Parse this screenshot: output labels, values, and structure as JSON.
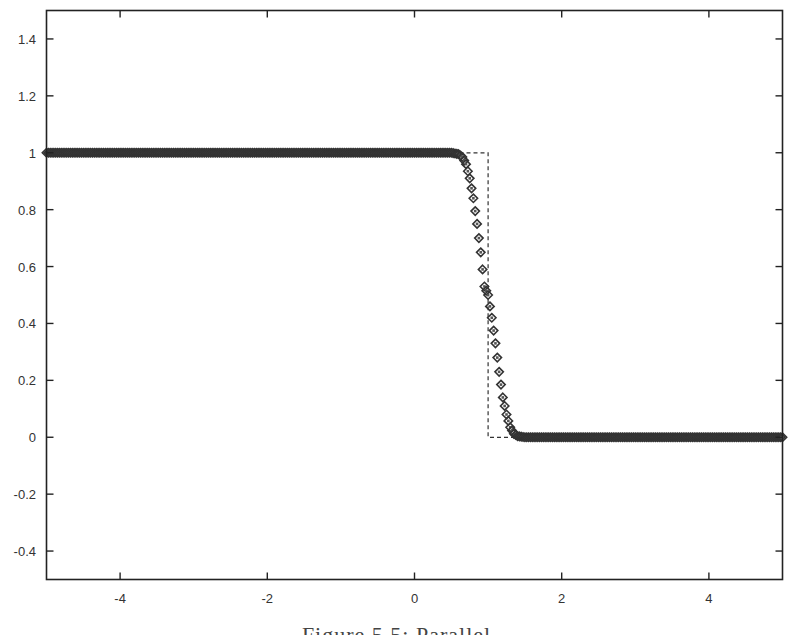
{
  "chart_data": {
    "type": "scatter",
    "title": "",
    "xlabel": "",
    "ylabel": "",
    "xlim": [
      -5,
      5
    ],
    "ylim": [
      -0.5,
      1.5
    ],
    "grid": false,
    "legend": null,
    "x_ticks": [
      -4,
      -2,
      0,
      2,
      4
    ],
    "x_tick_labels": [
      "-4",
      "-2",
      "0",
      "2",
      "4"
    ],
    "y_ticks": [
      -0.4,
      -0.2,
      0,
      0.2,
      0.4,
      0.6,
      0.8,
      1,
      1.2,
      1.4
    ],
    "y_tick_labels": [
      "-0.4",
      "-0.2",
      "0",
      "0.2",
      "0.4",
      "0.6",
      "0.8",
      "1",
      "1.2",
      "1.4"
    ],
    "series": [
      {
        "name": "numerical solution",
        "style": "diamond-markers",
        "color": "#333333",
        "profile": "smoothed step, 1 for x < 0.6, 0 for x > 1.4, centered at x = 1",
        "n_points": 401,
        "x": [
          -5,
          -4,
          -3,
          -2,
          -1,
          0,
          0.5,
          0.6,
          0.65,
          0.7,
          0.75,
          0.8,
          0.85,
          0.9,
          0.95,
          1.0,
          1.05,
          1.1,
          1.15,
          1.2,
          1.25,
          1.3,
          1.35,
          1.4,
          1.5,
          2,
          3,
          4,
          5
        ],
        "y": [
          1,
          1,
          1,
          1,
          1,
          1,
          1.0,
          0.995,
          0.985,
          0.96,
          0.91,
          0.84,
          0.75,
          0.65,
          0.53,
          0.5,
          0.42,
          0.33,
          0.23,
          0.14,
          0.08,
          0.035,
          0.012,
          0.004,
          0,
          0,
          0,
          0,
          0
        ]
      },
      {
        "name": "exact solution",
        "style": "dashed-line",
        "color": "#333333",
        "x": [
          -5,
          1,
          1,
          5
        ],
        "y": [
          1,
          1,
          0,
          0
        ]
      }
    ],
    "caption": "Figure 5.5: Parallel"
  }
}
